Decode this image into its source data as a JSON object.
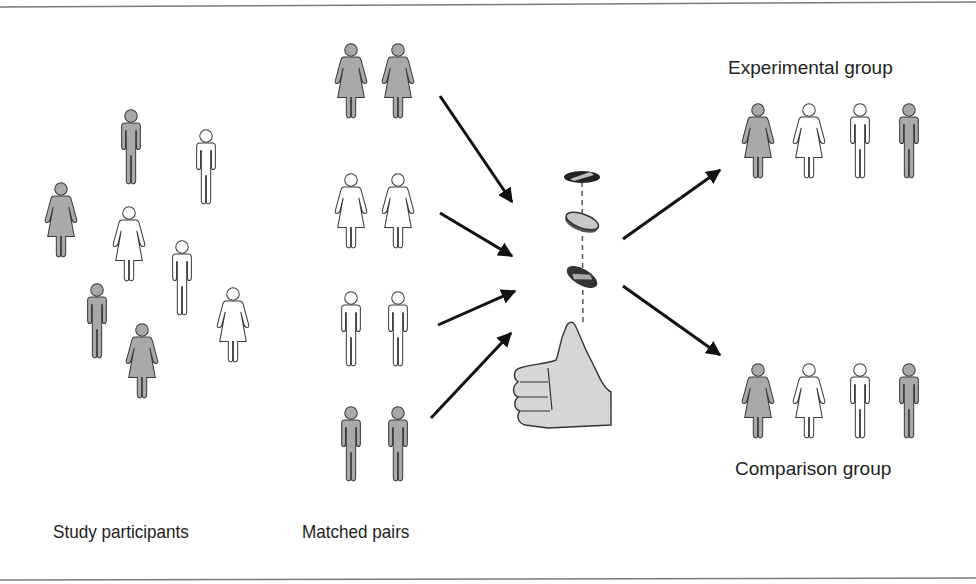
{
  "colors": {
    "shaded": "#a9a9a9",
    "open": "#ffffff",
    "outline": "#3a3a3a",
    "arrow": "#111111",
    "hand": "#d6d6d6",
    "rule": "#7a7a7a"
  },
  "labels": {
    "study_participants": "Study participants",
    "matched_pairs": "Matched pairs",
    "experimental_group": "Experimental group",
    "comparison_group": "Comparison group"
  },
  "study_participants": [
    {
      "gender": "male",
      "shade": "shaded"
    },
    {
      "gender": "male",
      "shade": "open"
    },
    {
      "gender": "female",
      "shade": "shaded"
    },
    {
      "gender": "female",
      "shade": "open"
    },
    {
      "gender": "male",
      "shade": "open"
    },
    {
      "gender": "male",
      "shade": "shaded"
    },
    {
      "gender": "female",
      "shade": "shaded"
    },
    {
      "gender": "female",
      "shade": "open"
    }
  ],
  "matched_pairs": [
    {
      "gender": "female",
      "shade": "shaded"
    },
    {
      "gender": "female",
      "shade": "open"
    },
    {
      "gender": "male",
      "shade": "open"
    },
    {
      "gender": "male",
      "shade": "shaded"
    }
  ],
  "experimental_group": [
    {
      "gender": "female",
      "shade": "shaded"
    },
    {
      "gender": "female",
      "shade": "open"
    },
    {
      "gender": "male",
      "shade": "open"
    },
    {
      "gender": "male",
      "shade": "shaded"
    }
  ],
  "comparison_group": [
    {
      "gender": "female",
      "shade": "shaded"
    },
    {
      "gender": "female",
      "shade": "open"
    },
    {
      "gender": "male",
      "shade": "open"
    },
    {
      "gender": "male",
      "shade": "shaded"
    }
  ],
  "randomizer": {
    "icon": "coin-toss-thumb-icon",
    "coins": 3
  }
}
